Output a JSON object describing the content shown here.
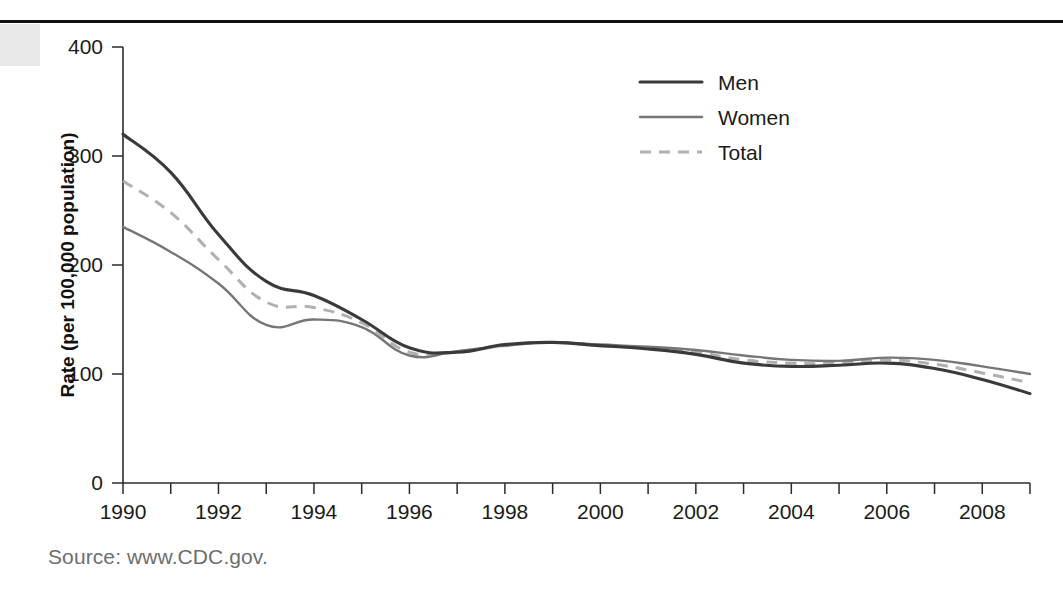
{
  "figure": {
    "source_note": "Source: www.CDC.gov."
  },
  "chart_data": {
    "type": "line",
    "title": "",
    "xlabel": "Year",
    "ylabel": "Rate (per 100,000 population)",
    "xlim": [
      1990,
      2009
    ],
    "ylim": [
      0,
      400
    ],
    "grid": false,
    "legend_position": "top-center-right",
    "y_ticks": [
      0,
      100,
      200,
      300,
      400
    ],
    "y_tick_labels": [
      "0",
      "100",
      "200",
      "300",
      "400"
    ],
    "x_ticks": [
      1990,
      1991,
      1992,
      1993,
      1994,
      1995,
      1996,
      1997,
      1998,
      1999,
      2000,
      2001,
      2002,
      2003,
      2004,
      2005,
      2006,
      2007,
      2008,
      2009
    ],
    "x_tick_labels_shown": [
      "1990",
      "1992",
      "1994",
      "1996",
      "1998",
      "2000",
      "2002",
      "2004",
      "2006",
      "2008"
    ],
    "x": [
      1990,
      1991,
      1992,
      1993,
      1994,
      1995,
      1996,
      1997,
      1998,
      1999,
      2000,
      2001,
      2002,
      2003,
      2004,
      2005,
      2006,
      2007,
      2008,
      2009
    ],
    "series": [
      {
        "name": "Men",
        "style": "solid",
        "color": "#3a3a3a",
        "values": [
          320,
          285,
          228,
          185,
          172,
          150,
          124,
          120,
          127,
          129,
          126,
          123,
          118,
          110,
          107,
          108,
          110,
          105,
          95,
          82
        ]
      },
      {
        "name": "Women",
        "style": "solid",
        "color": "#767676",
        "values": [
          235,
          212,
          183,
          145,
          150,
          143,
          117,
          121,
          126,
          129,
          127,
          125,
          122,
          117,
          113,
          112,
          115,
          113,
          107,
          100
        ]
      },
      {
        "name": "Total",
        "style": "dashed",
        "color": "#b0b0b0",
        "values": [
          277,
          248,
          205,
          166,
          161,
          147,
          120,
          120,
          126,
          129,
          126,
          124,
          120,
          113,
          110,
          110,
          113,
          109,
          101,
          92
        ]
      }
    ]
  }
}
